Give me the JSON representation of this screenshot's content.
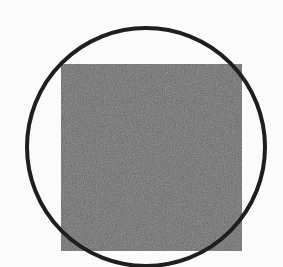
{
  "figure": {
    "background": "#fbfbfb",
    "square": {
      "x": 61,
      "y": 64,
      "width": 181,
      "height": 187,
      "fill": "#666666"
    },
    "circle": {
      "cx": 146,
      "cy": 147,
      "r": 119,
      "stroke": "#1e1e1e",
      "stroke_width": 4
    }
  }
}
